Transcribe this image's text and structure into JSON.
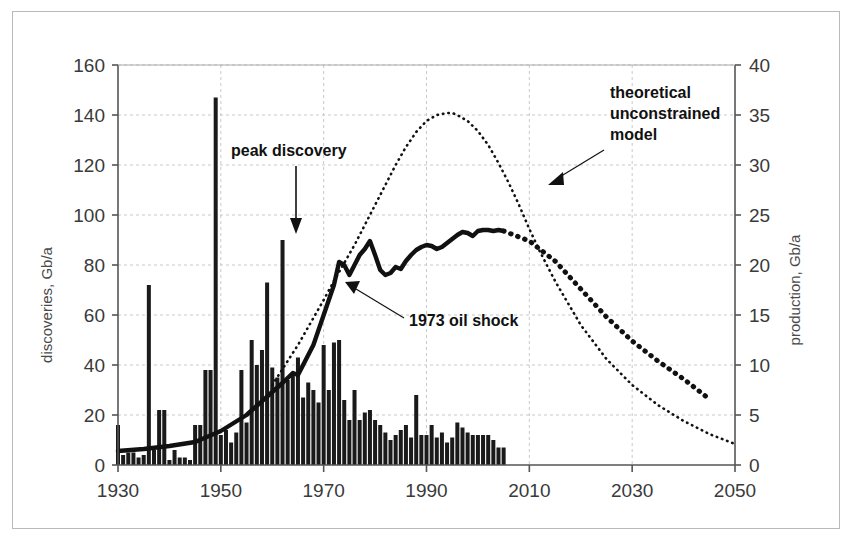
{
  "chart_data": {
    "type": "bar",
    "title": "",
    "xlabel": "",
    "ylabel": "discoveries, Gb/a",
    "y2label": "production, Gb/a",
    "xlim": [
      1930,
      2050
    ],
    "ylim": [
      0,
      160
    ],
    "y2lim": [
      0,
      40
    ],
    "xticks": [
      "1930",
      "1950",
      "1970",
      "1990",
      "2010",
      "2030",
      "2050"
    ],
    "xtick_values": [
      1930,
      1950,
      1970,
      1990,
      2010,
      2030,
      2050
    ],
    "yticks": [
      "0",
      "20",
      "40",
      "60",
      "80",
      "100",
      "120",
      "140",
      "160"
    ],
    "ytick_values": [
      0,
      20,
      40,
      60,
      80,
      100,
      120,
      140,
      160
    ],
    "y2ticks": [
      "0",
      "5",
      "10",
      "15",
      "20",
      "25",
      "30",
      "35",
      "40"
    ],
    "y2tick_values": [
      0,
      5,
      10,
      15,
      20,
      25,
      30,
      35,
      40
    ],
    "grid": true,
    "legend_position": "none",
    "bar_color": "#1a1a1a",
    "line_color": "#111111",
    "grid_color": "#c9c9c9",
    "series": [
      {
        "name": "discoveries",
        "type": "bar",
        "axis": "left",
        "unit": "Gb/a",
        "x": [
          1930,
          1931,
          1932,
          1933,
          1934,
          1935,
          1936,
          1937,
          1938,
          1939,
          1940,
          1941,
          1942,
          1943,
          1944,
          1945,
          1946,
          1947,
          1948,
          1949,
          1950,
          1951,
          1952,
          1953,
          1954,
          1955,
          1956,
          1957,
          1958,
          1959,
          1960,
          1961,
          1962,
          1963,
          1964,
          1965,
          1966,
          1967,
          1968,
          1969,
          1970,
          1971,
          1972,
          1973,
          1974,
          1975,
          1976,
          1977,
          1978,
          1979,
          1980,
          1981,
          1982,
          1983,
          1984,
          1985,
          1986,
          1987,
          1988,
          1989,
          1990,
          1991,
          1992,
          1993,
          1994,
          1995,
          1996,
          1997,
          1998,
          1999,
          2000,
          2001,
          2002,
          2003,
          2004,
          2005
        ],
        "values": [
          16,
          4,
          5,
          5,
          3,
          4,
          72,
          6,
          22,
          22,
          2,
          6,
          3,
          3,
          2,
          16,
          16,
          38,
          38,
          147,
          12,
          14,
          9,
          13,
          38,
          17,
          50,
          40,
          46,
          73,
          39,
          35,
          90,
          34,
          37,
          43,
          27,
          33,
          30,
          25,
          48,
          30,
          49,
          50,
          26,
          18,
          30,
          18,
          21,
          22,
          18,
          16,
          13,
          10,
          12,
          14,
          16,
          11,
          28,
          12,
          12,
          16,
          11,
          13,
          9,
          11,
          17,
          15,
          13,
          12,
          12,
          12,
          12,
          10,
          7,
          7
        ]
      },
      {
        "name": "production",
        "type": "line",
        "style": "thick-dashed",
        "axis": "right",
        "unit": "Gb/a",
        "x": [
          1930,
          1935,
          1940,
          1945,
          1950,
          1955,
          1960,
          1962,
          1964,
          1965,
          1966,
          1968,
          1970,
          1972,
          1973,
          1974,
          1975,
          1976,
          1977,
          1978,
          1979,
          1980,
          1981,
          1982,
          1983,
          1984,
          1985,
          1986,
          1987,
          1988,
          1989,
          1990,
          1991,
          1992,
          1993,
          1994,
          1995,
          1996,
          1997,
          1998,
          1999,
          2000,
          2001,
          2002,
          2003,
          2004,
          2005,
          2010,
          2015,
          2020,
          2025,
          2030,
          2035,
          2040,
          2045
        ],
        "values": [
          1.4,
          1.6,
          1.9,
          2.3,
          3.4,
          5.0,
          7.3,
          8.2,
          9.2,
          9.0,
          10.0,
          12.0,
          15.0,
          18.0,
          20.3,
          20.0,
          19.0,
          20.0,
          21.0,
          21.6,
          22.4,
          21.0,
          19.5,
          19.0,
          19.2,
          19.8,
          19.6,
          20.4,
          21.0,
          21.5,
          21.8,
          22.0,
          21.9,
          21.6,
          21.8,
          22.2,
          22.6,
          23.0,
          23.3,
          23.2,
          22.9,
          23.4,
          23.5,
          23.5,
          23.4,
          23.5,
          23.4,
          22.4,
          20.4,
          17.6,
          14.8,
          12.4,
          10.4,
          8.6,
          6.6
        ]
      },
      {
        "name": "theoretical unconstrained model",
        "type": "line",
        "style": "fine-dotted",
        "axis": "right",
        "unit": "Gb/a",
        "x": [
          1960,
          1965,
          1970,
          1972,
          1974,
          1976,
          1978,
          1980,
          1982,
          1984,
          1986,
          1988,
          1990,
          1992,
          1994,
          1995,
          1996,
          1998,
          2000,
          2002,
          2004,
          2006,
          2008,
          2010,
          2012,
          2015,
          2020,
          2025,
          2030,
          2035,
          2040,
          2045,
          2050
        ],
        "values": [
          8.0,
          12.0,
          16.5,
          18.4,
          20.2,
          22.0,
          24.0,
          26.0,
          28.0,
          30.0,
          31.8,
          33.3,
          34.4,
          35.0,
          35.2,
          35.2,
          35.0,
          34.4,
          33.4,
          32.0,
          30.2,
          28.2,
          26.0,
          23.6,
          21.4,
          18.4,
          14.0,
          10.6,
          8.0,
          6.0,
          4.4,
          3.1,
          2.1
        ]
      }
    ],
    "annotations": [
      {
        "id": "peak-discovery",
        "text": "peak discovery",
        "target_x": 1962,
        "target_y_left": 90,
        "arrow": "down"
      },
      {
        "id": "oil-shock",
        "text": "1973 oil shock",
        "target_x": 1973,
        "target_y_right": 20.3,
        "arrow": "up-left"
      },
      {
        "id": "unconstrained-model",
        "text": "theoretical\nunconstrained\nmodel",
        "line1": "theoretical",
        "line2": "unconstrained",
        "line3": "model",
        "target_x": 2004,
        "target_y_right": 28.5,
        "arrow": "down-left"
      }
    ]
  }
}
